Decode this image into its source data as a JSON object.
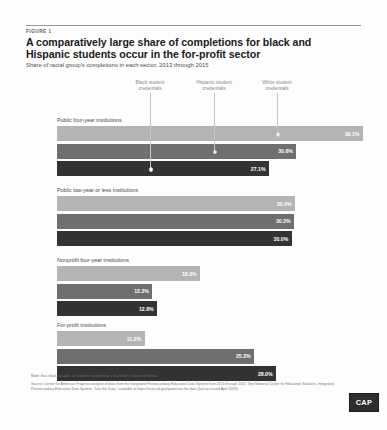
{
  "figure": {
    "label": "FIGURE 1",
    "title": "A comparatively large share of completions for black and Hispanic students occur in the for-profit sector",
    "subtitle": "Share of racial group's completions in each sector, 2013 through 2015"
  },
  "legend": [
    {
      "name": "black-student-credentials",
      "line1": "Black student",
      "line2": "credentials",
      "color": "#333333"
    },
    {
      "name": "hispanic-student-credentials",
      "line1": "Hispanic student",
      "line2": "credentials",
      "color": "#6f6f6f"
    },
    {
      "name": "white-student-credentials",
      "line1": "White student",
      "line2": "credentials",
      "color": "#b4b4b4"
    }
  ],
  "footer": {
    "note": "Note: this chart includes all students completing a bachelor's degree or below.",
    "source": "Source: Center for American Progress analysis of data from the Integrated Postsecondary Education Data System from 2013 through 2015. See National Center for Education Statistics, Integrated Postsecondary Education Data System, \"Use the Data,\" available at https://nces.ed.gov/ipeds/use-the-data (last accessed April 2018).",
    "logo": "CAP"
  },
  "chart_data": {
    "type": "bar",
    "title": "A comparatively large share of completions for black and Hispanic students occur in the for-profit sector",
    "subtitle": "Share of racial group's completions in each sector, 2013 through 2015",
    "xlabel": "",
    "ylabel": "",
    "xlim": [
      0,
      40
    ],
    "grid": false,
    "orientation": "horizontal",
    "legend_position": "top",
    "categories": [
      "Public four-year institutions",
      "Public two-year or less institutions",
      "Nonprofit four-year institutions",
      "For-profit institutions"
    ],
    "series": [
      {
        "name": "White student credentials",
        "color": "#b4b4b4",
        "values": [
          39.1,
          30.4,
          18.3,
          11.2
        ],
        "labels": [
          "39.1%",
          "30.4%",
          "18.3%",
          "11.2%"
        ]
      },
      {
        "name": "Hispanic student credentials",
        "color": "#6f6f6f",
        "values": [
          30.6,
          30.3,
          12.2,
          25.2
        ],
        "labels": [
          "30.6%",
          "30.3%",
          "12.2%",
          "25.2%"
        ]
      },
      {
        "name": "Black student credentials",
        "color": "#333333",
        "values": [
          27.1,
          30.0,
          12.8,
          28.0
        ],
        "labels": [
          "27.1%",
          "30.0%",
          "12.8%",
          "28.0%"
        ]
      }
    ]
  }
}
